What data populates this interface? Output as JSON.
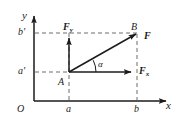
{
  "figure": {
    "kind": "vector-decomposition-diagram",
    "width": 178,
    "height": 124,
    "background_color": "#ffffff",
    "line_color": "#1b1b1b",
    "dashed_color": "#6d6d6d"
  },
  "axes": {
    "x_label": "x",
    "y_label": "y",
    "origin_label": "O"
  },
  "ticks": {
    "x": [
      {
        "label": "a",
        "value_x": 69
      },
      {
        "label": "b",
        "value_x": 137
      }
    ],
    "y": [
      {
        "label": "a'",
        "value_y": 72
      },
      {
        "label": "b'",
        "value_y": 33
      }
    ]
  },
  "points": [
    {
      "name": "A",
      "label": "A",
      "x": 69,
      "y": 72
    },
    {
      "name": "B",
      "label": "B",
      "x": 137,
      "y": 33
    }
  ],
  "vectors": [
    {
      "name": "resultant",
      "label": "F",
      "from": "A",
      "to": "B"
    },
    {
      "name": "x-component",
      "label": "F",
      "subscript": "x",
      "from": "A",
      "to_x": 137,
      "to_y": 72
    },
    {
      "name": "y-component",
      "label": "F",
      "subscript": "y",
      "from": "A",
      "to_x": 69,
      "to_y": 33
    }
  ],
  "angle": {
    "label": "α",
    "at": "A",
    "between": [
      "x-component",
      "resultant"
    ]
  }
}
